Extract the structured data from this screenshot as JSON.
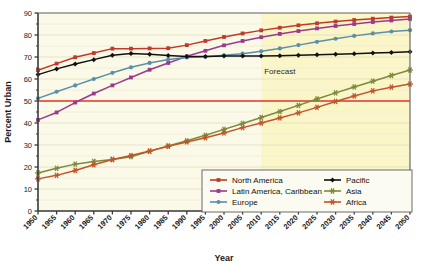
{
  "chart_data": {
    "type": "line",
    "title": "",
    "xlabel": "Year",
    "ylabel": "Percent Urban",
    "xlim": [
      1950,
      2050
    ],
    "ylim": [
      0,
      90
    ],
    "ytick_step": 10,
    "xtick_step": 5,
    "grid": "horizontal",
    "legend_position": "bottom-right",
    "x": [
      1950,
      1955,
      1960,
      1965,
      1970,
      1975,
      1980,
      1985,
      1990,
      1995,
      2000,
      2005,
      2010,
      2015,
      2020,
      2025,
      2030,
      2035,
      2040,
      2045,
      2050
    ],
    "xtick_labels": [
      "1950",
      "1955",
      "1960",
      "1965",
      "1970",
      "1975",
      "1980",
      "1985",
      "1990",
      "1995",
      "2000",
      "2005",
      "2010",
      "2015",
      "2020",
      "2025",
      "2030",
      "2035",
      "2040",
      "2045",
      "2050"
    ],
    "ytick_labels": [
      "0",
      "10",
      "20",
      "30",
      "40",
      "50",
      "60",
      "70",
      "80",
      "90"
    ],
    "series": [
      {
        "name": "North America",
        "color": "#C0392B",
        "marker": "square",
        "values": [
          64.0,
          67.0,
          69.9,
          71.8,
          73.8,
          73.8,
          73.9,
          74.0,
          75.4,
          77.3,
          79.1,
          80.7,
          82.1,
          83.3,
          84.4,
          85.3,
          86.1,
          86.8,
          87.4,
          87.9,
          88.4
        ]
      },
      {
        "name": "Latin America, Caribbean",
        "color": "#9B3A8C",
        "marker": "square",
        "values": [
          41.4,
          44.8,
          49.3,
          53.4,
          57.1,
          60.7,
          64.2,
          67.3,
          70.3,
          72.8,
          75.3,
          77.3,
          79.0,
          80.5,
          81.8,
          83.0,
          84.1,
          85.0,
          85.9,
          86.6,
          87.3
        ]
      },
      {
        "name": "Europe",
        "color": "#5B8FA8",
        "marker": "circle",
        "values": [
          51.2,
          54.2,
          57.1,
          60.0,
          62.8,
          65.3,
          67.3,
          68.9,
          69.8,
          70.1,
          70.8,
          71.5,
          72.6,
          73.9,
          75.4,
          76.9,
          78.3,
          79.6,
          80.7,
          81.6,
          82.2
        ]
      },
      {
        "name": "Pacific",
        "color": "#111111",
        "marker": "diamond",
        "values": [
          62.0,
          64.6,
          66.8,
          68.8,
          70.8,
          71.6,
          71.2,
          70.7,
          70.2,
          70.2,
          70.4,
          70.4,
          70.5,
          70.6,
          70.8,
          71.0,
          71.2,
          71.5,
          71.8,
          72.1,
          72.4
        ]
      },
      {
        "name": "Asia",
        "color": "#7B8B3A",
        "marker": "star",
        "values": [
          17.3,
          19.4,
          21.3,
          22.5,
          23.4,
          24.7,
          27.1,
          29.6,
          31.9,
          34.4,
          37.1,
          39.8,
          42.5,
          45.2,
          48.0,
          50.9,
          53.7,
          56.4,
          59.0,
          61.6,
          64.1
        ]
      },
      {
        "name": "Africa",
        "color": "#C0552B",
        "marker": "star",
        "values": [
          14.6,
          16.2,
          18.4,
          21.0,
          23.4,
          25.2,
          27.3,
          29.4,
          31.4,
          33.3,
          35.5,
          37.9,
          40.0,
          42.3,
          44.6,
          47.1,
          49.8,
          52.3,
          54.6,
          56.3,
          57.7
        ]
      }
    ],
    "annotations": [
      {
        "name": "forecast-label",
        "text": "Forecast",
        "x": 2015,
        "y": 62.5
      },
      {
        "name": "fifty-percent-reference-line",
        "text": "",
        "y": 50,
        "color": "#E8352C"
      }
    ],
    "forecast_start_year": 2010,
    "forecast_band_color": "#FAF6C8",
    "plot_background_color": "#FBF9E7",
    "gridline_color": "#E4DFC4"
  }
}
